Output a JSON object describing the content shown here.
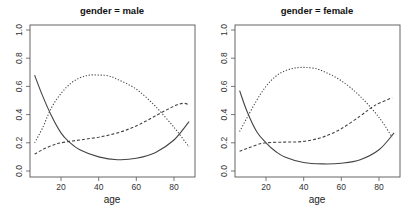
{
  "chart_data": [
    {
      "type": "line",
      "title": "gender = male",
      "xlabel": "age",
      "ylabel": "",
      "xlim": [
        3,
        92
      ],
      "ylim": [
        0,
        1.0
      ],
      "xticks": [
        20,
        40,
        60,
        80
      ],
      "yticks": [
        0.0,
        0.2,
        0.4,
        0.6,
        0.8,
        1.0
      ],
      "ytick_labels": [
        "0.0",
        "0.2",
        "0.4",
        "0.6",
        "0.8",
        "1.0"
      ],
      "grid": false,
      "legend": null,
      "series": [
        {
          "name": "solid",
          "style": "solid",
          "x": [
            6,
            10,
            15,
            20,
            24,
            30,
            40,
            50,
            60,
            70,
            80,
            88
          ],
          "y": [
            0.68,
            0.54,
            0.39,
            0.27,
            0.21,
            0.15,
            0.1,
            0.08,
            0.09,
            0.13,
            0.22,
            0.35
          ]
        },
        {
          "name": "dotted",
          "style": "dotted",
          "x": [
            6,
            10,
            15,
            20,
            25,
            30,
            35,
            40,
            45,
            50,
            60,
            70,
            80,
            88
          ],
          "y": [
            0.2,
            0.3,
            0.45,
            0.55,
            0.62,
            0.66,
            0.68,
            0.68,
            0.675,
            0.65,
            0.58,
            0.46,
            0.31,
            0.17
          ]
        },
        {
          "name": "dashed",
          "style": "dashed",
          "x": [
            6,
            10,
            15,
            20,
            30,
            40,
            50,
            60,
            70,
            80,
            85,
            88
          ],
          "y": [
            0.12,
            0.15,
            0.18,
            0.2,
            0.22,
            0.24,
            0.27,
            0.32,
            0.39,
            0.46,
            0.48,
            0.47
          ]
        }
      ]
    },
    {
      "type": "line",
      "title": "gender = female",
      "xlabel": "age",
      "ylabel": "",
      "xlim": [
        3,
        92
      ],
      "ylim": [
        0,
        1.0
      ],
      "xticks": [
        20,
        40,
        60,
        80
      ],
      "yticks": [
        0.0,
        0.2,
        0.4,
        0.6,
        0.8,
        1.0
      ],
      "ytick_labels": [
        "0.0",
        "0.2",
        "0.4",
        "0.6",
        "0.8",
        "1.0"
      ],
      "grid": false,
      "legend": null,
      "series": [
        {
          "name": "solid",
          "style": "solid",
          "x": [
            6,
            10,
            15,
            20,
            25,
            30,
            40,
            50,
            60,
            70,
            80,
            88
          ],
          "y": [
            0.57,
            0.42,
            0.28,
            0.2,
            0.14,
            0.1,
            0.06,
            0.05,
            0.055,
            0.08,
            0.15,
            0.27
          ]
        },
        {
          "name": "dotted",
          "style": "dotted",
          "x": [
            6,
            10,
            15,
            20,
            25,
            30,
            35,
            40,
            45,
            50,
            60,
            70,
            80,
            87
          ],
          "y": [
            0.28,
            0.38,
            0.5,
            0.6,
            0.67,
            0.71,
            0.73,
            0.735,
            0.73,
            0.71,
            0.64,
            0.53,
            0.38,
            0.24
          ]
        },
        {
          "name": "dashed",
          "style": "dashed",
          "x": [
            6,
            10,
            15,
            20,
            30,
            40,
            50,
            60,
            70,
            76,
            80,
            87
          ],
          "y": [
            0.14,
            0.16,
            0.185,
            0.2,
            0.205,
            0.21,
            0.24,
            0.3,
            0.39,
            0.45,
            0.48,
            0.52
          ]
        }
      ]
    }
  ],
  "panels": [
    {
      "title": "gender = male",
      "xlabel": "age",
      "xtick_labels": [
        "20",
        "40",
        "60",
        "80"
      ],
      "ytick_labels": [
        "0.0",
        "0.2",
        "0.4",
        "0.6",
        "0.8",
        "1.0"
      ]
    },
    {
      "title": "gender = female",
      "xlabel": "age",
      "xtick_labels": [
        "20",
        "40",
        "60",
        "80"
      ],
      "ytick_labels": [
        "0.0",
        "0.2",
        "0.4",
        "0.6",
        "0.8",
        "1.0"
      ]
    }
  ]
}
